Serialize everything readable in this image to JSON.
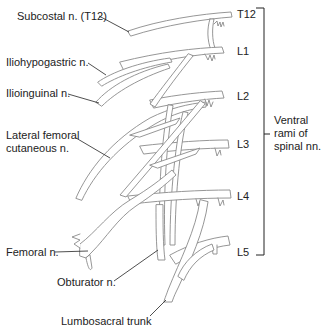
{
  "figure": {
    "labels": {
      "subcostal": "Subcostal n. (T12)",
      "iliohypogastric": "Iliohypogastric n.",
      "ilioinguinal": "Ilioinguinal n.",
      "lateral_femoral_line1": "Lateral femoral",
      "lateral_femoral_line2": "cutaneous n.",
      "femoral": "Femoral n.",
      "obturator": "Obturator n.",
      "lumbosacral": "Lumbosacral trunk"
    },
    "levels": [
      "T12",
      "L1",
      "L2",
      "L3",
      "L4",
      "L5"
    ],
    "bracket_label": {
      "line1": "Ventral",
      "line2": "rami of",
      "line3": "spinal nn."
    },
    "colors": {
      "nerve_outline": "#8a8a8a",
      "nerve_fill": "#ffffff",
      "text": "#222222"
    }
  }
}
